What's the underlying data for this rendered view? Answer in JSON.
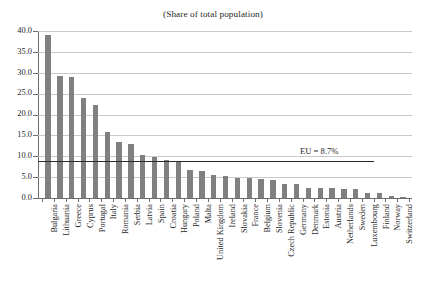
{
  "chart_data": {
    "type": "bar",
    "title": "(Share of total population)",
    "xlabel": "",
    "ylabel": "",
    "ylim": [
      0.0,
      40.0
    ],
    "ytick_labels": [
      "0.0",
      "5.0",
      "10.0",
      "15.0",
      "20.0",
      "25.0",
      "30.0",
      "35.0",
      "40.0"
    ],
    "ytick_values": [
      0.0,
      5.0,
      10.0,
      15.0,
      20.0,
      25.0,
      30.0,
      35.0,
      40.0
    ],
    "grid": true,
    "legend": "none",
    "categories": [
      "Bulgaria",
      "Lithuania",
      "Greece",
      "Cyprus",
      "Portugal",
      "Italy",
      "Romania",
      "Serbia",
      "Latvia",
      "Spain",
      "Croatia",
      "Hungary",
      "Poland",
      "Malta",
      "United Kingdom",
      "Ireland",
      "Slovakia",
      "France",
      "Belgium",
      "Slovenia",
      "Czech Republic",
      "Germany",
      "Denmark",
      "Estonia",
      "Austria",
      "Netherlands",
      "Sweden",
      "Luxembourg",
      "Finland",
      "Norway",
      "Switzerland"
    ],
    "values": [
      39.0,
      29.2,
      28.9,
      24.0,
      22.2,
      15.8,
      13.5,
      13.0,
      10.2,
      9.8,
      9.0,
      8.9,
      6.8,
      6.4,
      5.6,
      5.3,
      4.8,
      4.8,
      4.5,
      4.4,
      3.4,
      3.3,
      2.3,
      2.3,
      2.3,
      2.1,
      2.1,
      1.3,
      1.2,
      0.4,
      0.2
    ],
    "annotations": [
      {
        "name": "eu-average-line",
        "label": "EU = 8.7%",
        "value": 8.7
      }
    ]
  },
  "caption": {
    "text": ""
  }
}
